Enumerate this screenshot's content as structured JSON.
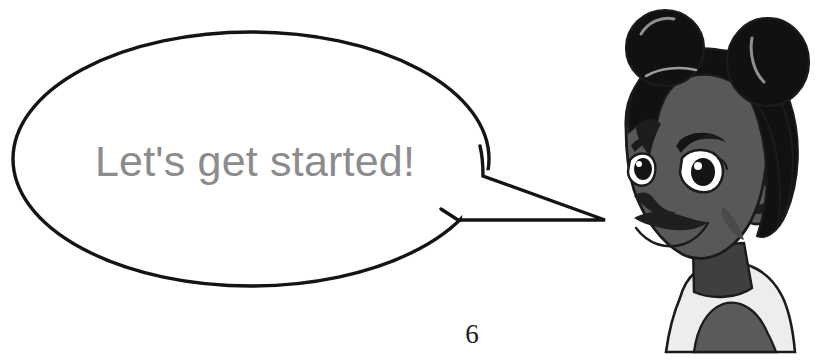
{
  "page": {
    "background_color": "#ffffff",
    "width": 839,
    "height": 360,
    "page_number": "6"
  },
  "speech_bubble": {
    "text": "Let's get started!",
    "text_color": "#8c8c8c",
    "fill_color": "#ffffff",
    "outline_color": "#141414",
    "shape": "ellipse-with-pointed-tail",
    "tail_direction": "right"
  },
  "character": {
    "description": "girl with two hair buns",
    "hair_color": "#111111",
    "hair_shade_color": "#262626",
    "skin_color": "#585858",
    "skin_shade_color": "#3f3f3f",
    "shirt_color": "#ededed",
    "shirt_shade_color": "#5a5a5a",
    "eye_white_color": "#ffffff",
    "outline_color": "#1b1b1b"
  }
}
